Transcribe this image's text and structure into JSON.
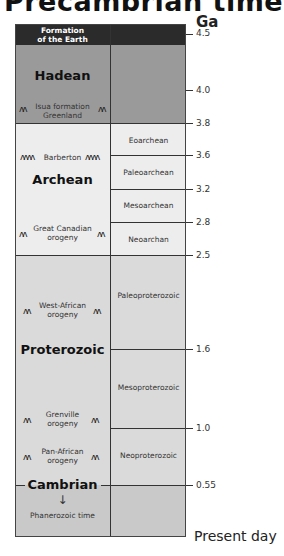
{
  "title": "Precambrian times",
  "unit": "Ga",
  "header": {
    "label_line1": "Formation",
    "label_line2": "of the Earth"
  },
  "eons": [
    {
      "name": "Hadean",
      "start": 4.5,
      "end": 3.8
    },
    {
      "name": "Archean",
      "start": 3.8,
      "end": 2.5
    },
    {
      "name": "Proterozoic",
      "start": 2.5,
      "end": 0.55
    },
    {
      "name": "Cambrian",
      "start": 0.55
    }
  ],
  "eras": [
    {
      "name": "Eoarchean",
      "start": 3.8,
      "end": 3.6
    },
    {
      "name": "Paleoarchean",
      "start": 3.6,
      "end": 3.2
    },
    {
      "name": "Mesoarchean",
      "start": 3.2,
      "end": 2.8
    },
    {
      "name": "Neoarchan",
      "start": 2.8,
      "end": 2.5
    },
    {
      "name": "Paleoproterozoic",
      "start": 2.5,
      "end": 1.6
    },
    {
      "name": "Mesoproterozoic",
      "start": 1.6,
      "end": 1.0
    },
    {
      "name": "Neoproterozoic",
      "start": 1.0,
      "end": 0.55
    }
  ],
  "events": [
    {
      "line1": "Isua formation",
      "line2": "Greenland"
    },
    {
      "line1": "Barberton",
      "line2": ""
    },
    {
      "line1": "Great Canadian",
      "line2": "orogeny"
    },
    {
      "line1": "West-African",
      "line2": "orogeny"
    },
    {
      "line1": "Grenville",
      "line2": "orogeny"
    },
    {
      "line1": "Pan-African",
      "line2": "orogeny"
    }
  ],
  "phanerozoic": {
    "arrow": "↓",
    "label": "Phanerozoic time"
  },
  "ticks": [
    "4.5",
    "4.0",
    "3.8",
    "3.6",
    "3.2",
    "2.8",
    "2.5",
    "1.6",
    "1.0",
    "0.55"
  ],
  "present_label": "Present day",
  "mountain_glyph": "ʌʌ",
  "mountain_glyph_long": "ʌʌʌʌ",
  "colors": {
    "header": "#2b2b2b",
    "hadean": "#9a9a9a",
    "archean": "#ededed",
    "proterozoic": "#dadada",
    "phanerozoic": "#c9c9c9"
  }
}
